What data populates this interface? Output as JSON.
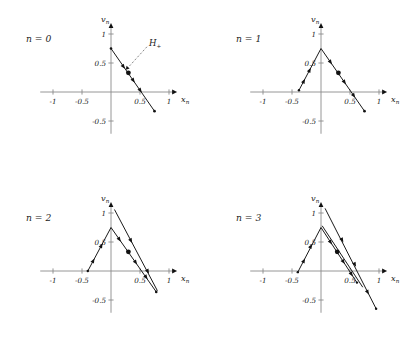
{
  "figure": {
    "background": "#ffffff",
    "stroke_color": "#1a1a1a",
    "axis_color": "#8a8a8a",
    "width": 420,
    "height": 359
  },
  "chart_data": {
    "type": "line",
    "title": "",
    "xlabel": "x_n",
    "ylabel": "v_n",
    "xlim": [
      -1.25,
      1.15
    ],
    "ylim": [
      -0.75,
      1.2
    ],
    "grid": false,
    "legend": null,
    "axis_labels": {
      "x": "x",
      "x_sub": "n",
      "y": "v",
      "y_sub": "n"
    },
    "x_ticks": [
      {
        "value": -1,
        "label": "-1"
      },
      {
        "value": -0.5,
        "label": "-0.5"
      },
      {
        "value": 0.5,
        "label": "0.5"
      },
      {
        "value": 1,
        "label": "1"
      }
    ],
    "y_ticks": [
      {
        "value": 1,
        "label": "1"
      },
      {
        "value": 0.5,
        "label": "0.5"
      },
      {
        "value": -0.5,
        "label": "-0.5"
      }
    ],
    "annotation": {
      "text": "H",
      "subscript": "+",
      "target_x": 0.2,
      "target_y": 0.33
    },
    "panels": [
      {
        "id": "panel-n0",
        "label": "n = 0",
        "label_text": "n",
        "label_eq": "= 0",
        "n": 0,
        "segments": [
          {
            "name": "descending-branch",
            "points": [
              [
                0.0,
                0.75
              ],
              [
                0.75,
                -0.33
              ]
            ],
            "width": 1.05
          }
        ],
        "markers": [
          {
            "x": 0.21,
            "y": 0.445,
            "size": 1.15,
            "type": "arrow",
            "angle": -55
          },
          {
            "x": 0.3,
            "y": 0.33,
            "size": 2.4,
            "type": "dot"
          },
          {
            "x": 0.38,
            "y": 0.205,
            "size": 1.15,
            "type": "arrow",
            "angle": -55
          },
          {
            "x": 0.5,
            "y": 0.035,
            "size": 1.15,
            "type": "arrow",
            "angle": -55
          },
          {
            "x": 0.75,
            "y": -0.33,
            "size": 1.3,
            "type": "dot"
          },
          {
            "x": 0.0,
            "y": 0.75,
            "size": 1.3,
            "type": "dot"
          }
        ]
      },
      {
        "id": "panel-n1",
        "label": "n = 1",
        "label_text": "n",
        "label_eq": "= 1",
        "n": 1,
        "segments": [
          {
            "name": "ascending-branch",
            "points": [
              [
                -0.38,
                0.03
              ],
              [
                0.0,
                0.75
              ]
            ],
            "width": 1.05
          },
          {
            "name": "descending-branch",
            "points": [
              [
                0.0,
                0.75
              ],
              [
                0.75,
                -0.33
              ]
            ],
            "width": 1.05
          }
        ],
        "markers": [
          {
            "x": -0.3,
            "y": 0.18,
            "size": 1.15,
            "type": "arrow",
            "angle": 62
          },
          {
            "x": -0.2,
            "y": 0.37,
            "size": 1.15,
            "type": "arrow",
            "angle": 62
          },
          {
            "x": 0.16,
            "y": 0.52,
            "size": 1.15,
            "type": "arrow",
            "angle": -55
          },
          {
            "x": 0.3,
            "y": 0.33,
            "size": 2.4,
            "type": "dot"
          },
          {
            "x": 0.4,
            "y": 0.175,
            "size": 1.15,
            "type": "arrow",
            "angle": -55
          },
          {
            "x": 0.56,
            "y": -0.055,
            "size": 1.15,
            "type": "arrow",
            "angle": -55
          },
          {
            "x": 0.75,
            "y": -0.33,
            "size": 1.3,
            "type": "dot"
          },
          {
            "x": -0.38,
            "y": 0.03,
            "size": 1.2,
            "type": "dot"
          }
        ]
      },
      {
        "id": "panel-n2",
        "label": "n = 2",
        "label_text": "n",
        "label_eq": "= 2",
        "n": 2,
        "segments": [
          {
            "name": "ascending-branch",
            "points": [
              [
                -0.4,
                0.0
              ],
              [
                0.0,
                0.75
              ]
            ],
            "width": 1.05
          },
          {
            "name": "descending-branch",
            "points": [
              [
                0.0,
                0.75
              ],
              [
                0.78,
                -0.36
              ]
            ],
            "width": 1.05
          },
          {
            "name": "outer-descending-branch",
            "points": [
              [
                0.06,
                1.06
              ],
              [
                0.8,
                -0.34
              ]
            ],
            "width": 0.85
          }
        ],
        "markers": [
          {
            "x": -0.31,
            "y": 0.17,
            "size": 1.15,
            "type": "arrow",
            "angle": 62
          },
          {
            "x": -0.17,
            "y": 0.43,
            "size": 1.15,
            "type": "arrow",
            "angle": 62
          },
          {
            "x": 0.14,
            "y": 0.55,
            "size": 1.15,
            "type": "arrow",
            "angle": -55
          },
          {
            "x": 0.3,
            "y": 0.33,
            "size": 2.4,
            "type": "dot"
          },
          {
            "x": 0.42,
            "y": 0.155,
            "size": 1.15,
            "type": "arrow",
            "angle": -55
          },
          {
            "x": 0.6,
            "y": -0.1,
            "size": 1.15,
            "type": "arrow",
            "angle": -55
          },
          {
            "x": 0.78,
            "y": -0.36,
            "size": 1.3,
            "type": "dot"
          },
          {
            "x": 0.34,
            "y": 0.53,
            "size": 1.15,
            "type": "arrow",
            "angle": -62
          },
          {
            "x": 0.63,
            "y": 0.0,
            "size": 1.15,
            "type": "arrow",
            "angle": -62
          },
          {
            "x": -0.4,
            "y": 0.0,
            "size": 1.2,
            "type": "dot"
          }
        ]
      },
      {
        "id": "panel-n3",
        "label": "n = 3",
        "label_text": "n",
        "label_eq": "= 3",
        "n": 3,
        "segments": [
          {
            "name": "ascending-branch",
            "points": [
              [
                -0.4,
                -0.02
              ],
              [
                0.0,
                0.75
              ]
            ],
            "width": 1.05
          },
          {
            "name": "descending-branch-inner",
            "points": [
              [
                0.0,
                0.75
              ],
              [
                0.62,
                -0.2
              ]
            ],
            "width": 1.05
          },
          {
            "name": "descending-branch-mid",
            "points": [
              [
                0.02,
                0.78
              ],
              [
                0.72,
                -0.28
              ]
            ],
            "width": 0.9
          },
          {
            "name": "outer-descending-branch",
            "points": [
              [
                0.07,
                1.08
              ],
              [
                0.95,
                -0.65
              ]
            ],
            "width": 0.85
          }
        ],
        "markers": [
          {
            "x": -0.3,
            "y": 0.17,
            "size": 1.15,
            "type": "arrow",
            "angle": 62
          },
          {
            "x": -0.18,
            "y": 0.42,
            "size": 1.15,
            "type": "arrow",
            "angle": 62
          },
          {
            "x": 0.16,
            "y": 0.5,
            "size": 1.15,
            "type": "arrow",
            "angle": -57
          },
          {
            "x": 0.28,
            "y": 0.33,
            "size": 2.4,
            "type": "dot"
          },
          {
            "x": 0.38,
            "y": 0.165,
            "size": 1.15,
            "type": "arrow",
            "angle": -57
          },
          {
            "x": 0.52,
            "y": -0.05,
            "size": 1.15,
            "type": "arrow",
            "angle": -57
          },
          {
            "x": 0.62,
            "y": -0.2,
            "size": 1.2,
            "type": "dot"
          },
          {
            "x": 0.36,
            "y": 0.54,
            "size": 1.15,
            "type": "arrow",
            "angle": -62
          },
          {
            "x": 0.58,
            "y": 0.12,
            "size": 1.15,
            "type": "arrow",
            "angle": -62
          },
          {
            "x": 0.8,
            "y": -0.36,
            "size": 1.15,
            "type": "arrow",
            "angle": -62
          },
          {
            "x": 0.95,
            "y": -0.65,
            "size": 1.2,
            "type": "dot"
          },
          {
            "x": -0.4,
            "y": -0.02,
            "size": 1.2,
            "type": "dot"
          }
        ]
      }
    ]
  }
}
